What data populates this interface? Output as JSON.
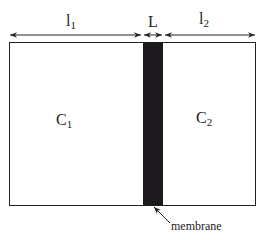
{
  "diagram": {
    "dimensions": {
      "l1": {
        "base": "l",
        "sub": "1"
      },
      "L": {
        "base": "L"
      },
      "l2": {
        "base": "l",
        "sub": "2"
      }
    },
    "compartments": {
      "c1": {
        "base": "C",
        "sub": "1"
      },
      "c2": {
        "base": "C",
        "sub": "2"
      }
    },
    "membrane_label": "membrane",
    "colors": {
      "membrane": "#1c1a1c",
      "line": "#222222",
      "background": "#ffffff"
    }
  }
}
